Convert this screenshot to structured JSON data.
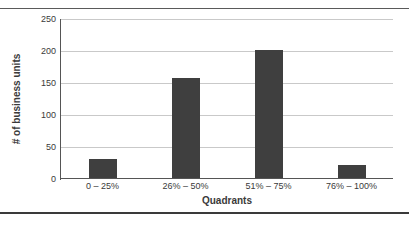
{
  "caption": {
    "text": ""
  },
  "chart_data": {
    "type": "bar",
    "title": "",
    "xlabel": "Quadrants",
    "ylabel": "# of business units",
    "categories": [
      "0 – 25%",
      "26% – 50%",
      "51% – 75%",
      "76% – 100%"
    ],
    "values": [
      32,
      158,
      201,
      22
    ],
    "ylim": [
      0,
      250
    ],
    "yticks": [
      0,
      50,
      100,
      150,
      200,
      250
    ],
    "ytick_labels": [
      "0",
      "50",
      "100",
      "150",
      "200",
      "250"
    ],
    "grid": "horizontal",
    "legend": "none",
    "bar_color": "#3f3f3f",
    "gridline_color": "#c9c9c9",
    "axis_color": "#555555"
  }
}
